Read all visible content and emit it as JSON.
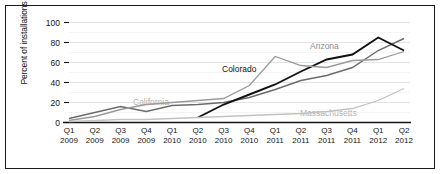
{
  "chart_data": {
    "type": "line",
    "title": "",
    "xlabel": "",
    "ylabel": "Percent of installations",
    "ylim": [
      0,
      100
    ],
    "yticks": [
      0,
      20,
      40,
      60,
      80,
      100
    ],
    "grid": true,
    "legend_position": "inline-labels",
    "categories": [
      "Q1 2009",
      "Q2 2009",
      "Q3 2009",
      "Q4 2009",
      "Q1 2010",
      "Q2 2010",
      "Q3 2010",
      "Q4 2010",
      "Q1 2011",
      "Q2 2011",
      "Q3 2011",
      "Q4 2011",
      "Q1 2012",
      "Q2 2012"
    ],
    "categories_split": [
      {
        "q": "Q1",
        "y": "2009"
      },
      {
        "q": "Q2",
        "y": "2009"
      },
      {
        "q": "Q3",
        "y": "2009"
      },
      {
        "q": "Q4",
        "y": "2009"
      },
      {
        "q": "Q1",
        "y": "2010"
      },
      {
        "q": "Q2",
        "y": "2010"
      },
      {
        "q": "Q3",
        "y": "2010"
      },
      {
        "q": "Q4",
        "y": "2010"
      },
      {
        "q": "Q1",
        "y": "2011"
      },
      {
        "q": "Q2",
        "y": "2011"
      },
      {
        "q": "Q3",
        "y": "2011"
      },
      {
        "q": "Q4",
        "y": "2011"
      },
      {
        "q": "Q1",
        "y": "2012"
      },
      {
        "q": "Q2",
        "y": "2012"
      }
    ],
    "series": [
      {
        "name": "Arizona",
        "color": "#6b6b6b",
        "width": 1.4,
        "label_x": 310,
        "label_y": 41,
        "label_class": "lbl-mid",
        "values": [
          4,
          10,
          16,
          11,
          17,
          18,
          20,
          25,
          33,
          42,
          47,
          55,
          72,
          84
        ]
      },
      {
        "name": "Colorado",
        "color": "#111111",
        "width": 1.9,
        "label_x": 222,
        "label_y": 64,
        "label_class": "lbl-dark",
        "values": [
          null,
          null,
          null,
          null,
          null,
          5,
          18,
          28,
          38,
          51,
          63,
          68,
          85,
          72
        ]
      },
      {
        "name": "California",
        "color": "#9a9a9a",
        "width": 1.3,
        "label_x": 133,
        "label_y": 97,
        "label_class": "lbl-gray",
        "values": [
          2,
          6,
          13,
          18,
          20,
          22,
          24,
          37,
          66,
          57,
          55,
          62,
          63,
          71
        ]
      },
      {
        "name": "Massachusetts",
        "color": "#c2c2c2",
        "width": 1.3,
        "label_x": 300,
        "label_y": 108,
        "label_class": "lbl-gray",
        "values": [
          1,
          2,
          3,
          3,
          4,
          5,
          6,
          7,
          8,
          9,
          11,
          14,
          22,
          34
        ]
      }
    ]
  },
  "axis": {
    "y_title": "Percent of installations",
    "y_tick_labels": [
      "100",
      "80",
      "60",
      "40",
      "20",
      "0"
    ]
  }
}
